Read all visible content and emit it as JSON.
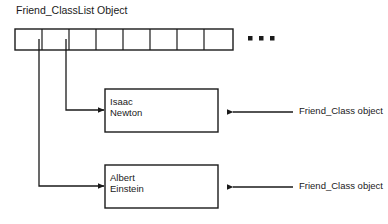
{
  "diagram": {
    "title": "Friend_ClassList Object",
    "background_color": "#ffffff",
    "stroke_color": "#1a1a1a",
    "text_color": "#1a1a1a"
  },
  "array": {
    "name": "Friend_ClassList Object",
    "cell_count": 8,
    "continuation_marker": "...",
    "pointer_cells": [
      1,
      2
    ]
  },
  "nodes": [
    {
      "id": "newton",
      "line1": "Isaac",
      "line2": "Newton",
      "annotation": "Friend_Class object"
    },
    {
      "id": "einstein",
      "line1": "Albert",
      "line2": "Einstein",
      "annotation": "Friend_Class object"
    }
  ],
  "annotations": {
    "newton": "Friend_Class object",
    "einstein": "Friend_Class object"
  }
}
